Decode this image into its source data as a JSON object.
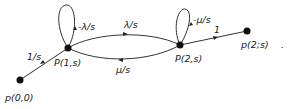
{
  "diagram": {
    "type": "signal-flow-graph",
    "nodes": [
      {
        "id": "p00",
        "label": "p(0,0)",
        "x": 20,
        "y": 80
      },
      {
        "id": "P1s",
        "label": "P(1,s)",
        "x": 68,
        "y": 48
      },
      {
        "id": "P2s",
        "label": "P(2,s)",
        "x": 180,
        "y": 45
      },
      {
        "id": "p2s",
        "label": "p(2;s)",
        "x": 247,
        "y": 31
      }
    ],
    "edges": [
      {
        "from": "p00",
        "to": "P1s",
        "label": "1/s"
      },
      {
        "from": "P1s",
        "to": "P1s",
        "label": "-λ/s"
      },
      {
        "from": "P1s",
        "to": "P2s",
        "label": "λ/s"
      },
      {
        "from": "P2s",
        "to": "P1s",
        "label": "μ/s"
      },
      {
        "from": "P2s",
        "to": "P2s",
        "label": "-μ/s"
      },
      {
        "from": "P2s",
        "to": "p2s",
        "label": "1"
      }
    ],
    "trailing_mark": "."
  }
}
